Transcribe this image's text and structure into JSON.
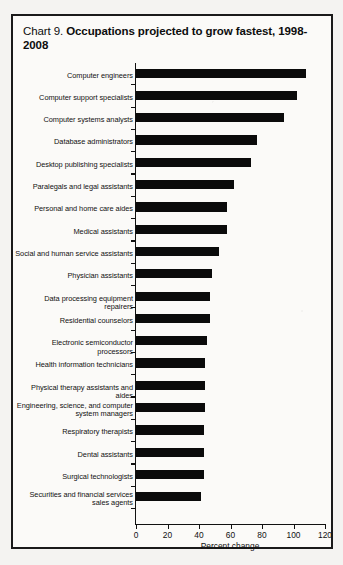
{
  "title": {
    "prefix": "Chart 9. ",
    "bold": "Occupations projected to grow fastest, 1998-2008"
  },
  "chart_data": {
    "type": "bar",
    "orientation": "horizontal",
    "title": "Chart 9. Occupations projected to grow fastest, 1998-2008",
    "xlabel": "Percent change",
    "ylabel": "",
    "xlim": [
      0,
      120
    ],
    "xticks": [
      0,
      20,
      40,
      60,
      80,
      100,
      120
    ],
    "xtick_labels": [
      "0",
      "20",
      "40",
      "60",
      "80",
      "100",
      "120"
    ],
    "grid": false,
    "legend": false,
    "bar_color": "#0b0b0b",
    "categories": [
      "Computer engineers",
      "Computer support specialists",
      "Computer systems analysts",
      "Database administrators",
      "Desktop publishing specialists",
      "Paralegals and legal assistants",
      "Personal and home care aides",
      "Medical assistants",
      "Social and human service assistants",
      "Physician assistants",
      "Data processing equipment repairers",
      "Residential counselors",
      "Electronic semiconductor processors",
      "Health information technicians",
      "Physical therapy assistants and aides",
      "Engineering, science, and computer\nsystem managers",
      "Respiratory therapists",
      "Dental assistants",
      "Surgical technologists",
      "Securities and financial services\nsales agents"
    ],
    "values": [
      108,
      102,
      94,
      77,
      73,
      62,
      58,
      58,
      53,
      48,
      47,
      47,
      45,
      44,
      44,
      44,
      43,
      43,
      43,
      41
    ]
  }
}
